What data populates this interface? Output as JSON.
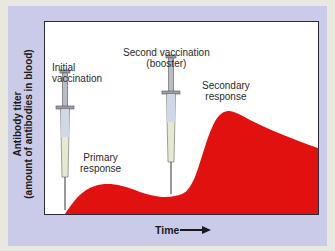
{
  "diagram": {
    "y_axis_label_line1": "Antibody titer",
    "y_axis_label_line2": "(amount of antibodies in blood)",
    "x_axis_label": "Time",
    "annotations": {
      "initial_vaccination_line1": "Initial",
      "initial_vaccination_line2": "vaccination",
      "second_vaccination_line1": "Second vaccination",
      "second_vaccination_line2": "(booster)",
      "primary_response_line1": "Primary",
      "primary_response_line2": "response",
      "secondary_response_line1": "Secondary",
      "secondary_response_line2": "response"
    },
    "colors": {
      "panel": "#c9cbe9",
      "curve_fill": "#e0110f",
      "plot_bg": "#ffffff"
    }
  }
}
